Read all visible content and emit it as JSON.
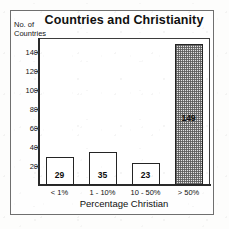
{
  "chart_data": {
    "type": "bar",
    "title": "Countries and Christianity",
    "xlabel": "Percentage Christian",
    "ylabel": "No. of\nCountries",
    "ylabel_lines": [
      "No. of",
      "Countries"
    ],
    "categories": [
      "< 1%",
      "1 - 10%",
      "10 - 50%",
      "> 50%"
    ],
    "values": [
      29,
      35,
      23,
      149
    ],
    "value_labels": [
      "29",
      "35",
      "23",
      "149"
    ],
    "ylim": [
      0,
      155
    ],
    "yticks": [
      20,
      40,
      60,
      80,
      100,
      120,
      140
    ],
    "ytick_labels": [
      "20",
      "40",
      "60",
      "80",
      "100",
      "120",
      "140"
    ],
    "grid": false,
    "legend": null,
    "bar_fills": [
      "white",
      "white",
      "white",
      "hatched-gray"
    ]
  },
  "figure": {
    "border_color": "#6f6f6f",
    "axis_color": "#2a2a2a",
    "bar_outline_color": "#242424",
    "hatch_color": "#5a5a5a",
    "background": "#fefefe"
  }
}
